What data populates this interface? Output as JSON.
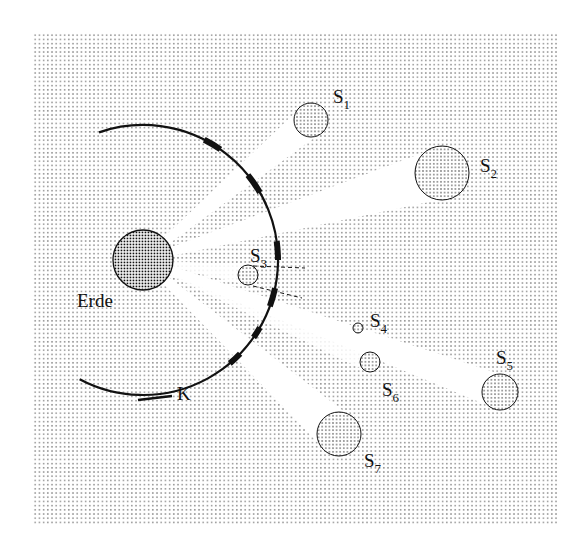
{
  "diagram": {
    "canvas": {
      "width": 583,
      "height": 551,
      "background": "#ffffff"
    },
    "panel": {
      "x": 33,
      "y": 32,
      "width": 525,
      "height": 493,
      "dot_color": "#9a9a9a",
      "dot_spacing": 4.2
    },
    "earth": {
      "label": "Erde",
      "cx": 143,
      "cy": 260,
      "r": 30,
      "label_x": 77,
      "label_y": 307
    },
    "circle_label": {
      "text": "K",
      "x": 177,
      "y": 400
    },
    "arc": {
      "cx": 143,
      "cy": 260,
      "r": 135,
      "start_deg": -109,
      "end_deg": 118,
      "tail": {
        "x1": 138,
        "y1": 400,
        "x2": 172,
        "y2": 396
      },
      "thick_segments_deg": [
        [
          -63,
          -55
        ],
        [
          -39,
          -30
        ],
        [
          -8,
          0
        ],
        [
          12,
          20
        ],
        [
          30,
          35
        ],
        [
          44,
          50
        ]
      ]
    },
    "stars": [
      {
        "id": "S1",
        "base": "S",
        "sub": "1",
        "cx": 311,
        "cy": 120,
        "r": 17,
        "label_x": 333,
        "label_y": 103,
        "beam": true
      },
      {
        "id": "S2",
        "base": "S",
        "sub": "2",
        "cx": 442,
        "cy": 173,
        "r": 27,
        "label_x": 480,
        "label_y": 172,
        "beam": true
      },
      {
        "id": "S3",
        "base": "S",
        "sub": "3",
        "cx": 248,
        "cy": 275,
        "r": 10,
        "label_x": 250,
        "label_y": 262,
        "beam": false
      },
      {
        "id": "S4",
        "base": "S",
        "sub": "4",
        "cx": 358,
        "cy": 328,
        "r": 5,
        "label_x": 370,
        "label_y": 327,
        "beam": false
      },
      {
        "id": "S5",
        "base": "S",
        "sub": "5",
        "cx": 500,
        "cy": 392,
        "r": 18,
        "label_x": 496,
        "label_y": 364,
        "beam": true
      },
      {
        "id": "S6",
        "base": "S",
        "sub": "6",
        "cx": 370,
        "cy": 362,
        "r": 10,
        "label_x": 382,
        "label_y": 396,
        "beam": false
      },
      {
        "id": "S7",
        "base": "S",
        "sub": "7",
        "cx": 339,
        "cy": 434,
        "r": 22,
        "label_x": 364,
        "label_y": 467,
        "beam": true
      }
    ],
    "s3_parallax_lines": [
      {
        "x1": 253,
        "y1": 266,
        "x2": 305,
        "y2": 268
      },
      {
        "x1": 253,
        "y1": 286,
        "x2": 302,
        "y2": 298
      }
    ],
    "colors": {
      "ink": "#111111",
      "star_dots": "#222222",
      "earth_dots": "#111111",
      "beam": "#ffffff"
    }
  }
}
